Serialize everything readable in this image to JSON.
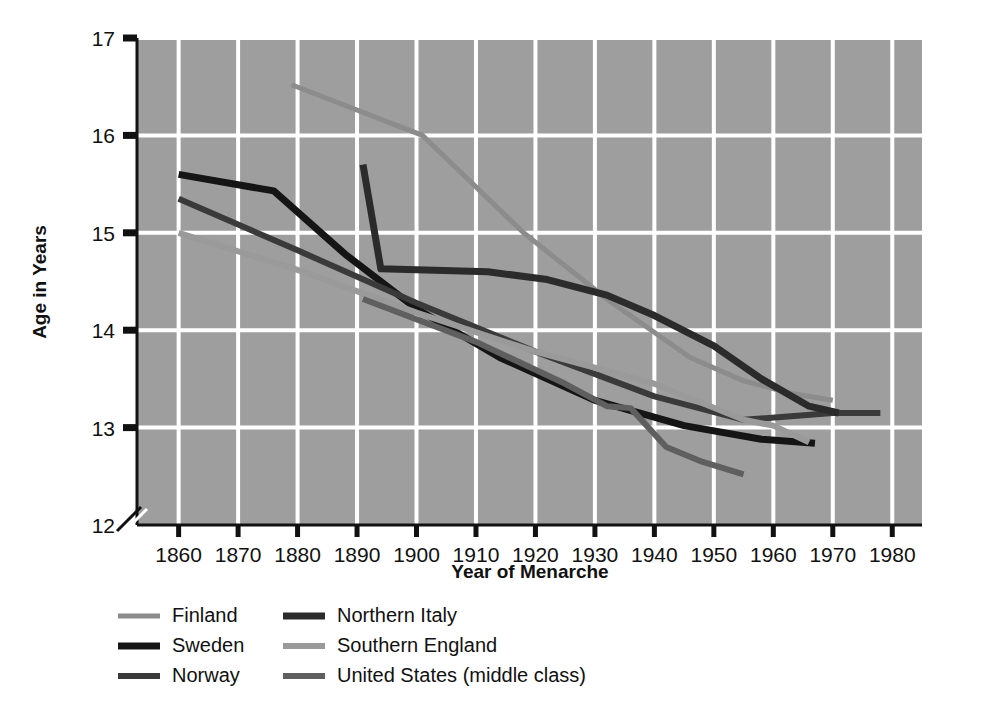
{
  "chart_data": {
    "type": "line",
    "title": "",
    "xlabel": "Year of Menarche",
    "ylabel": "Age in Years",
    "xlim": [
      1853,
      1985
    ],
    "ylim": [
      12,
      17
    ],
    "xticks": [
      1860,
      1870,
      1880,
      1890,
      1900,
      1910,
      1920,
      1930,
      1940,
      1950,
      1960,
      1970,
      1980
    ],
    "yticks": [
      12,
      13,
      14,
      15,
      16,
      17
    ],
    "grid": true,
    "y_axis_break": true,
    "y_axis_break_between": [
      12,
      13
    ],
    "plot_background": "#9e9e9e",
    "grid_color": "#ffffff",
    "legend_position": "below-plot",
    "legend_columns": 2,
    "series": [
      {
        "name": "Finland",
        "color": "#8c8c8c",
        "width": 5,
        "points": [
          [
            1879,
            16.52
          ],
          [
            1901,
            16.0
          ],
          [
            1918,
            15.0
          ],
          [
            1932,
            14.32
          ],
          [
            1946,
            13.72
          ],
          [
            1955,
            13.48
          ],
          [
            1963,
            13.35
          ],
          [
            1970,
            13.28
          ]
        ]
      },
      {
        "name": "Sweden",
        "color": "#151515",
        "width": 7,
        "points": [
          [
            1860,
            15.6
          ],
          [
            1876,
            15.43
          ],
          [
            1888,
            14.78
          ],
          [
            1900,
            14.22
          ],
          [
            1914,
            13.72
          ],
          [
            1930,
            13.28
          ],
          [
            1945,
            13.02
          ],
          [
            1958,
            12.88
          ],
          [
            1967,
            12.84
          ]
        ]
      },
      {
        "name": "Norway",
        "color": "#3a3a3a",
        "width": 6,
        "points": [
          [
            1860,
            15.35
          ],
          [
            1880,
            14.82
          ],
          [
            1900,
            14.28
          ],
          [
            1920,
            13.78
          ],
          [
            1940,
            13.32
          ],
          [
            1955,
            13.08
          ],
          [
            1970,
            13.15
          ],
          [
            1978,
            13.15
          ]
        ]
      },
      {
        "name": "Northern Italy",
        "color": "#2b2b2b",
        "width": 7,
        "points": [
          [
            1891,
            15.7
          ],
          [
            1894,
            14.63
          ],
          [
            1912,
            14.6
          ],
          [
            1922,
            14.52
          ],
          [
            1932,
            14.36
          ],
          [
            1940,
            14.15
          ],
          [
            1950,
            13.84
          ],
          [
            1958,
            13.5
          ],
          [
            1966,
            13.22
          ],
          [
            1971,
            13.15
          ]
        ]
      },
      {
        "name": "Southern England",
        "color": "#9a9a9a",
        "width": 6,
        "points": [
          [
            1860,
            15.0
          ],
          [
            1880,
            14.62
          ],
          [
            1900,
            14.18
          ],
          [
            1920,
            13.78
          ],
          [
            1940,
            13.45
          ],
          [
            1955,
            13.08
          ],
          [
            1960,
            13.02
          ],
          [
            1966,
            12.85
          ]
        ]
      },
      {
        "name": "United States (middle class)",
        "color": "#5f5f5f",
        "width": 6,
        "points": [
          [
            1891,
            14.32
          ],
          [
            1910,
            13.88
          ],
          [
            1925,
            13.45
          ],
          [
            1932,
            13.22
          ],
          [
            1936,
            13.2
          ],
          [
            1942,
            12.8
          ],
          [
            1948,
            12.65
          ],
          [
            1955,
            12.52
          ]
        ]
      }
    ]
  },
  "legend": {
    "entries": [
      {
        "label": "Finland"
      },
      {
        "label": "Northern Italy"
      },
      {
        "label": "Sweden"
      },
      {
        "label": "Southern England"
      },
      {
        "label": "Norway"
      },
      {
        "label": "United States (middle class)"
      }
    ]
  }
}
